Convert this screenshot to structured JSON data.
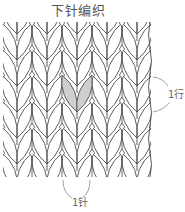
{
  "diagram": {
    "title": "下针编织",
    "row_label": "1行",
    "stitch_label": "1针",
    "fabric": {
      "stitch_columns_x": [
        17,
        47,
        77,
        107,
        137
      ],
      "row_junctions_y": [
        34,
        60,
        86,
        112,
        138,
        164,
        190
      ],
      "stitch_half_width": 15,
      "stitch_height": 37,
      "leaf_bulge": 11,
      "clip": {
        "x": 3,
        "y": 22,
        "width": 148,
        "height": 155
      },
      "highlighted_stitch": {
        "column": 2,
        "row": 3
      }
    },
    "colors": {
      "background": "#ffffff",
      "line": "#4a4a4a",
      "highlight_fill": "#cfcfcf",
      "text": "#555555",
      "annotation_line": "#8a8a8a"
    }
  }
}
